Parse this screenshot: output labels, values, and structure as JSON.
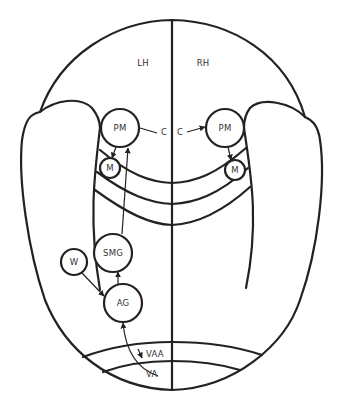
{
  "diagram": {
    "type": "brain-connectivity-schematic",
    "hemispheres": {
      "left": "LH",
      "right": "RH"
    },
    "nodes": {
      "pm_left": "PM",
      "pm_right": "PM",
      "m_left": "M",
      "m_right": "M",
      "c_left": "C",
      "c_right": "C",
      "smg": "SMG",
      "w": "W",
      "ag": "AG",
      "vaa": "VAA",
      "va": "VA"
    },
    "edges": [
      {
        "from": "VA",
        "to": "AG"
      },
      {
        "from": "VAA",
        "to": "VA"
      },
      {
        "from": "W",
        "to": "AG"
      },
      {
        "from": "AG",
        "to": "SMG"
      },
      {
        "from": "SMG",
        "to": "PM (LH)"
      },
      {
        "from": "PM (LH)",
        "to": "M (LH)"
      },
      {
        "from": "PM (LH)",
        "to": "PM (RH)",
        "via": "C"
      },
      {
        "from": "PM (RH)",
        "to": "M (RH)"
      }
    ],
    "colors": {
      "line": "#222222",
      "background": "#ffffff"
    }
  }
}
